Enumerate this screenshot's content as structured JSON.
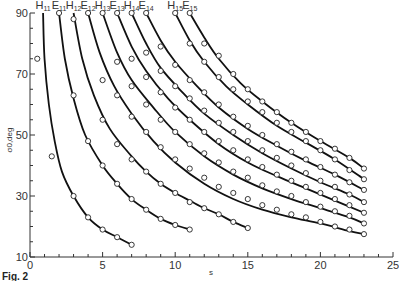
{
  "figure_label": "Fig. 2",
  "chart_data": {
    "type": "line",
    "title": "",
    "xlabel": "s",
    "ylabel": "σ0,deg",
    "xlim": [
      0,
      25
    ],
    "ylim": [
      10,
      90
    ],
    "x_ticks": [
      "0",
      "5",
      "10",
      "15",
      "20",
      "25"
    ],
    "y_ticks": [
      "10",
      "30",
      "50",
      "70",
      "90"
    ],
    "grid": false,
    "legend_position": "curve labels at top",
    "series": [
      {
        "name": "H11",
        "line": [
          [
            0.9,
            90
          ],
          [
            1.0,
            75
          ],
          [
            1.3,
            60
          ],
          [
            1.7,
            48
          ],
          [
            2.2,
            38
          ],
          [
            3,
            30
          ],
          [
            4,
            23
          ],
          [
            5,
            19
          ],
          [
            6,
            16.5
          ],
          [
            7,
            14
          ]
        ],
        "markers": [
          [
            0.5,
            75
          ],
          [
            1.5,
            43
          ],
          [
            3,
            30
          ],
          [
            4,
            23
          ],
          [
            5,
            19
          ],
          [
            6,
            16.5
          ],
          [
            7,
            14
          ]
        ]
      },
      {
        "name": "E11",
        "line": [
          [
            2,
            90
          ],
          [
            2.4,
            75
          ],
          [
            3,
            62
          ],
          [
            3.8,
            50
          ],
          [
            5,
            40
          ],
          [
            6,
            34
          ],
          [
            7,
            29
          ],
          [
            8,
            25.5
          ],
          [
            9,
            22.5
          ],
          [
            10,
            20.5
          ],
          [
            11,
            19
          ]
        ],
        "markers": [
          [
            2,
            90
          ],
          [
            4,
            48
          ],
          [
            5,
            40
          ],
          [
            6,
            34
          ],
          [
            7,
            29
          ],
          [
            8,
            25.5
          ],
          [
            9,
            22.5
          ],
          [
            10,
            20.5
          ],
          [
            11,
            19
          ]
        ]
      },
      {
        "name": "H12",
        "line": [
          [
            3,
            90
          ],
          [
            3.6,
            75
          ],
          [
            4.4,
            63
          ],
          [
            5.5,
            52
          ],
          [
            7,
            43
          ],
          [
            8,
            38
          ],
          [
            9,
            34
          ],
          [
            10,
            31
          ],
          [
            11,
            28.5
          ],
          [
            12,
            26
          ],
          [
            13,
            24
          ],
          [
            14,
            21.5
          ],
          [
            15,
            19.5
          ]
        ],
        "markers": [
          [
            3,
            88
          ],
          [
            3,
            63
          ],
          [
            5,
            55
          ],
          [
            6,
            47
          ],
          [
            7,
            42
          ],
          [
            8,
            38
          ],
          [
            9,
            34
          ],
          [
            10,
            31
          ],
          [
            11,
            28
          ],
          [
            12,
            26
          ],
          [
            13,
            24
          ],
          [
            14,
            21.5
          ],
          [
            15,
            19.5
          ]
        ]
      },
      {
        "name": "E12",
        "line": [
          [
            4,
            90
          ],
          [
            4.8,
            77
          ],
          [
            5.8,
            66
          ],
          [
            7,
            57
          ],
          [
            8.5,
            48
          ],
          [
            10,
            41
          ],
          [
            12,
            34
          ],
          [
            14,
            29
          ],
          [
            16,
            25.5
          ],
          [
            18,
            23
          ],
          [
            20,
            21
          ],
          [
            22,
            18.5
          ],
          [
            23,
            17.5
          ]
        ],
        "markers": [
          [
            4,
            90
          ],
          [
            5,
            68
          ],
          [
            6,
            63
          ],
          [
            7,
            56
          ],
          [
            8,
            51
          ],
          [
            9,
            46
          ],
          [
            10,
            42
          ],
          [
            11,
            39
          ],
          [
            12,
            36
          ],
          [
            13,
            33
          ],
          [
            14,
            31
          ],
          [
            15,
            29
          ],
          [
            16,
            27
          ],
          [
            17,
            25.5
          ],
          [
            18,
            24
          ],
          [
            19,
            23
          ],
          [
            20,
            21.5
          ],
          [
            21,
            20
          ],
          [
            22,
            19
          ],
          [
            23,
            17.5
          ]
        ]
      },
      {
        "name": "H13",
        "line": [
          [
            5,
            90
          ],
          [
            6,
            77
          ],
          [
            7,
            68
          ],
          [
            8.5,
            59
          ],
          [
            10,
            51
          ],
          [
            12,
            43
          ],
          [
            14,
            37
          ],
          [
            16,
            32.5
          ],
          [
            18,
            29
          ],
          [
            20,
            26
          ],
          [
            22,
            23
          ],
          [
            23,
            21
          ]
        ],
        "markers": [
          [
            5,
            90
          ],
          [
            6,
            74
          ],
          [
            7,
            66
          ],
          [
            8,
            60
          ],
          [
            9,
            55
          ],
          [
            10,
            51
          ],
          [
            11,
            47
          ],
          [
            12,
            44
          ],
          [
            13,
            41
          ],
          [
            14,
            38
          ],
          [
            15,
            36
          ],
          [
            16,
            33.5
          ],
          [
            17,
            31.5
          ],
          [
            18,
            30
          ],
          [
            19,
            28
          ],
          [
            20,
            26.5
          ],
          [
            21,
            25
          ],
          [
            22,
            23.5
          ],
          [
            23,
            21
          ]
        ]
      },
      {
        "name": "E13",
        "line": [
          [
            6,
            90
          ],
          [
            7,
            79
          ],
          [
            8,
            71
          ],
          [
            9.5,
            62
          ],
          [
            11,
            55
          ],
          [
            13,
            47
          ],
          [
            15,
            41
          ],
          [
            17,
            36.5
          ],
          [
            19,
            32.5
          ],
          [
            21,
            28.5
          ],
          [
            23,
            24.5
          ]
        ],
        "markers": [
          [
            6,
            90
          ],
          [
            7,
            75
          ],
          [
            8,
            69
          ],
          [
            9,
            64
          ],
          [
            10,
            59
          ],
          [
            11,
            55
          ],
          [
            12,
            51
          ],
          [
            13,
            48
          ],
          [
            14,
            45
          ],
          [
            15,
            42
          ],
          [
            16,
            39.5
          ],
          [
            17,
            37
          ],
          [
            18,
            35
          ],
          [
            19,
            33
          ],
          [
            20,
            31
          ],
          [
            21,
            29
          ],
          [
            22,
            27
          ],
          [
            23,
            24.5
          ]
        ]
      },
      {
        "name": "H14",
        "line": [
          [
            7,
            90
          ],
          [
            8,
            80
          ],
          [
            9,
            72
          ],
          [
            10.5,
            64
          ],
          [
            12,
            57
          ],
          [
            14,
            50
          ],
          [
            16,
            44
          ],
          [
            18,
            39
          ],
          [
            20,
            34.5
          ],
          [
            22,
            30.5
          ],
          [
            23,
            28
          ]
        ],
        "markers": [
          [
            7,
            90
          ],
          [
            8,
            77
          ],
          [
            9,
            71
          ],
          [
            10,
            66
          ],
          [
            11,
            62
          ],
          [
            12,
            58
          ],
          [
            13,
            54
          ],
          [
            14,
            51
          ],
          [
            15,
            48
          ],
          [
            16,
            45
          ],
          [
            17,
            42.5
          ],
          [
            18,
            40
          ],
          [
            19,
            37.5
          ],
          [
            20,
            35
          ],
          [
            21,
            33
          ],
          [
            22,
            30.5
          ],
          [
            23,
            28
          ]
        ]
      },
      {
        "name": "E14",
        "line": [
          [
            8,
            90
          ],
          [
            9,
            81
          ],
          [
            10,
            74
          ],
          [
            11.5,
            66
          ],
          [
            13,
            59
          ],
          [
            15,
            52
          ],
          [
            17,
            46.5
          ],
          [
            19,
            41.5
          ],
          [
            21,
            37
          ],
          [
            23,
            32
          ]
        ],
        "markers": [
          [
            8,
            90
          ],
          [
            9,
            79
          ],
          [
            10,
            73
          ],
          [
            11,
            68
          ],
          [
            12,
            64
          ],
          [
            13,
            60
          ],
          [
            14,
            56
          ],
          [
            15,
            53
          ],
          [
            16,
            50
          ],
          [
            17,
            47
          ],
          [
            18,
            44.5
          ],
          [
            19,
            42
          ],
          [
            20,
            39.5
          ],
          [
            21,
            37
          ],
          [
            22,
            34.5
          ],
          [
            23,
            32
          ]
        ]
      },
      {
        "name": "H15",
        "line": [
          [
            10,
            90
          ],
          [
            11,
            81
          ],
          [
            12,
            74
          ],
          [
            13.5,
            66
          ],
          [
            15,
            60
          ],
          [
            17,
            53
          ],
          [
            19,
            47.5
          ],
          [
            21,
            42
          ],
          [
            23,
            35.5
          ]
        ],
        "markers": [
          [
            10,
            90
          ],
          [
            11,
            80
          ],
          [
            12,
            74
          ],
          [
            13,
            69
          ],
          [
            14,
            65
          ],
          [
            15,
            61
          ],
          [
            16,
            57.5
          ],
          [
            17,
            54
          ],
          [
            18,
            51
          ],
          [
            19,
            48
          ],
          [
            20,
            45
          ],
          [
            21,
            42
          ],
          [
            22,
            38.5
          ],
          [
            23,
            35.5
          ]
        ]
      },
      {
        "name": "E15",
        "line": [
          [
            11,
            90
          ],
          [
            12,
            82
          ],
          [
            13,
            75
          ],
          [
            14.5,
            67
          ],
          [
            16,
            61
          ],
          [
            18,
            54
          ],
          [
            20,
            48
          ],
          [
            22,
            42.5
          ],
          [
            23,
            39
          ]
        ],
        "markers": [
          [
            11,
            90
          ],
          [
            12,
            80
          ],
          [
            13,
            76
          ],
          [
            14,
            70
          ],
          [
            15,
            65
          ],
          [
            16,
            61
          ],
          [
            17,
            57.5
          ],
          [
            18,
            54
          ],
          [
            19,
            51
          ],
          [
            20,
            48
          ],
          [
            21,
            45.5
          ],
          [
            22,
            42.5
          ],
          [
            23,
            39
          ]
        ]
      }
    ]
  }
}
